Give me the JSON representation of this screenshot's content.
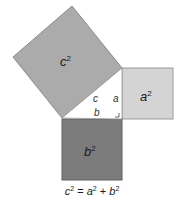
{
  "squares": {
    "c": {
      "label": "c",
      "exponent": "2",
      "fill": "#ababab",
      "stroke": "#8a8a8a"
    },
    "a": {
      "label": "a",
      "exponent": "2",
      "fill": "#d4d4d4",
      "stroke": "#9a9a9a"
    },
    "b": {
      "label": "b",
      "exponent": "2",
      "fill": "#7c7c7c",
      "stroke": "#5e5e5e"
    }
  },
  "triangle": {
    "side_c": "c",
    "side_a": "a",
    "side_b": "b",
    "right_angle_marker": "right-angle"
  },
  "equation": {
    "lhs_var": "c",
    "lhs_exp": "2",
    "equals": " = ",
    "a_var": "a",
    "a_exp": "2",
    "plus": " + ",
    "b_var": "b",
    "b_exp": "2"
  }
}
